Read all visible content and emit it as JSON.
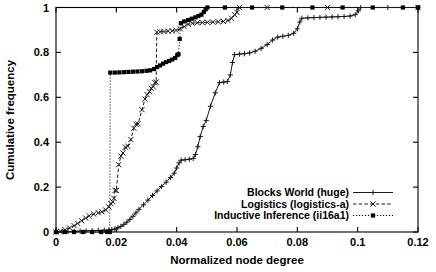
{
  "chart_data": {
    "type": "line",
    "title": "",
    "xlabel": "Normalized node degree",
    "ylabel": "Cumulative frequency",
    "xlim": [
      0,
      0.12
    ],
    "ylim": [
      0,
      1
    ],
    "xticks": [
      "0",
      "0.02",
      "0.04",
      "0.06",
      "0.08",
      "0.1",
      "0.12"
    ],
    "xtick_values": [
      0,
      0.02,
      0.04,
      0.06,
      0.08,
      0.1,
      0.12
    ],
    "yticks": [
      "0",
      "0.2",
      "0.4",
      "0.6",
      "0.8",
      "1"
    ],
    "ytick_values": [
      0,
      0.2,
      0.4,
      0.6,
      0.8,
      1
    ],
    "grid": false,
    "legend_position": "lower right",
    "series": [
      {
        "name": "Blocks World (huge)",
        "marker": "plus",
        "linestyle": "solid",
        "color": "#1a1a1a",
        "points": [
          [
            0.0,
            0.0
          ],
          [
            0.002,
            0.001
          ],
          [
            0.004,
            0.002
          ],
          [
            0.006,
            0.003
          ],
          [
            0.008,
            0.004
          ],
          [
            0.01,
            0.005
          ],
          [
            0.012,
            0.006
          ],
          [
            0.014,
            0.007
          ],
          [
            0.016,
            0.008
          ],
          [
            0.0175,
            0.009
          ],
          [
            0.0185,
            0.01
          ],
          [
            0.0195,
            0.013
          ],
          [
            0.0205,
            0.018
          ],
          [
            0.0215,
            0.025
          ],
          [
            0.0225,
            0.034
          ],
          [
            0.0235,
            0.044
          ],
          [
            0.0245,
            0.056
          ],
          [
            0.0255,
            0.07
          ],
          [
            0.0265,
            0.085
          ],
          [
            0.0275,
            0.101
          ],
          [
            0.029,
            0.121
          ],
          [
            0.0305,
            0.142
          ],
          [
            0.032,
            0.163
          ],
          [
            0.0335,
            0.183
          ],
          [
            0.035,
            0.203
          ],
          [
            0.0365,
            0.222
          ],
          [
            0.038,
            0.243
          ],
          [
            0.0392,
            0.262
          ],
          [
            0.04,
            0.285
          ],
          [
            0.0408,
            0.308
          ],
          [
            0.0415,
            0.32
          ],
          [
            0.0428,
            0.322
          ],
          [
            0.0442,
            0.324
          ],
          [
            0.0455,
            0.328
          ],
          [
            0.0462,
            0.345
          ],
          [
            0.047,
            0.38
          ],
          [
            0.0478,
            0.425
          ],
          [
            0.0488,
            0.47
          ],
          [
            0.0498,
            0.497
          ],
          [
            0.0512,
            0.56
          ],
          [
            0.0528,
            0.62
          ],
          [
            0.0542,
            0.665
          ],
          [
            0.0556,
            0.668
          ],
          [
            0.0568,
            0.67
          ],
          [
            0.0578,
            0.7
          ],
          [
            0.0585,
            0.755
          ],
          [
            0.0592,
            0.79
          ],
          [
            0.0608,
            0.792
          ],
          [
            0.0625,
            0.794
          ],
          [
            0.0642,
            0.798
          ],
          [
            0.066,
            0.805
          ],
          [
            0.068,
            0.818
          ],
          [
            0.07,
            0.835
          ],
          [
            0.0718,
            0.855
          ],
          [
            0.0735,
            0.868
          ],
          [
            0.0752,
            0.872
          ],
          [
            0.077,
            0.876
          ],
          [
            0.0788,
            0.885
          ],
          [
            0.08,
            0.905
          ],
          [
            0.0808,
            0.935
          ],
          [
            0.0815,
            0.952
          ],
          [
            0.0835,
            0.954
          ],
          [
            0.0855,
            0.955
          ],
          [
            0.0875,
            0.956
          ],
          [
            0.0895,
            0.957
          ],
          [
            0.0915,
            0.958
          ],
          [
            0.0935,
            0.959
          ],
          [
            0.0955,
            0.96
          ],
          [
            0.0975,
            0.962
          ],
          [
            0.0992,
            0.968
          ],
          [
            0.1002,
            0.985
          ],
          [
            0.101,
            1.0
          ],
          [
            0.11,
            1.0
          ],
          [
            0.12,
            1.0
          ]
        ]
      },
      {
        "name": "Logistics (logistics-a)",
        "marker": "cross",
        "linestyle": "dashed",
        "color": "#1a1a1a",
        "points": [
          [
            0.0,
            0.0
          ],
          [
            0.0015,
            0.004
          ],
          [
            0.003,
            0.01
          ],
          [
            0.0045,
            0.018
          ],
          [
            0.006,
            0.028
          ],
          [
            0.0072,
            0.038
          ],
          [
            0.0085,
            0.05
          ],
          [
            0.0098,
            0.062
          ],
          [
            0.011,
            0.072
          ],
          [
            0.0125,
            0.08
          ],
          [
            0.014,
            0.086
          ],
          [
            0.0152,
            0.09
          ],
          [
            0.0165,
            0.098
          ],
          [
            0.0175,
            0.112
          ],
          [
            0.0182,
            0.126
          ],
          [
            0.0188,
            0.135
          ],
          [
            0.0192,
            0.15
          ],
          [
            0.0196,
            0.185
          ],
          [
            0.02,
            0.185
          ],
          [
            0.0208,
            0.3
          ],
          [
            0.0215,
            0.338
          ],
          [
            0.0222,
            0.352
          ],
          [
            0.023,
            0.378
          ],
          [
            0.0238,
            0.382
          ],
          [
            0.0248,
            0.412
          ],
          [
            0.0258,
            0.462
          ],
          [
            0.0265,
            0.48
          ],
          [
            0.0272,
            0.482
          ],
          [
            0.0285,
            0.545
          ],
          [
            0.0295,
            0.592
          ],
          [
            0.0302,
            0.612
          ],
          [
            0.031,
            0.625
          ],
          [
            0.0316,
            0.64
          ],
          [
            0.0322,
            0.648
          ],
          [
            0.0328,
            0.665
          ],
          [
            0.0332,
            0.668
          ],
          [
            0.0334,
            0.89
          ],
          [
            0.0345,
            0.892
          ],
          [
            0.0358,
            0.893
          ],
          [
            0.0372,
            0.895
          ],
          [
            0.0385,
            0.896
          ],
          [
            0.0398,
            0.898
          ],
          [
            0.0412,
            0.905
          ],
          [
            0.0425,
            0.915
          ],
          [
            0.0438,
            0.925
          ],
          [
            0.0452,
            0.93
          ],
          [
            0.0468,
            0.932
          ],
          [
            0.0485,
            0.933
          ],
          [
            0.0502,
            0.934
          ],
          [
            0.052,
            0.935
          ],
          [
            0.0538,
            0.936
          ],
          [
            0.0555,
            0.938
          ],
          [
            0.057,
            0.942
          ],
          [
            0.0582,
            0.952
          ],
          [
            0.0592,
            0.968
          ],
          [
            0.06,
            0.978
          ],
          [
            0.0608,
            1.0
          ],
          [
            0.07,
            1.0
          ],
          [
            0.09,
            1.0
          ],
          [
            0.12,
            1.0
          ]
        ]
      },
      {
        "name": "Inductive Inference (ii16a1)",
        "marker": "square",
        "linestyle": "dotted",
        "color": "#000000",
        "points": [
          [
            0.0,
            0.0
          ],
          [
            0.003,
            0.0
          ],
          [
            0.006,
            0.0
          ],
          [
            0.009,
            0.0
          ],
          [
            0.012,
            0.0
          ],
          [
            0.015,
            0.0
          ],
          [
            0.017,
            0.0
          ],
          [
            0.0178,
            0.0
          ],
          [
            0.018,
            0.71
          ],
          [
            0.0195,
            0.71
          ],
          [
            0.021,
            0.711
          ],
          [
            0.0225,
            0.712
          ],
          [
            0.024,
            0.713
          ],
          [
            0.0255,
            0.714
          ],
          [
            0.027,
            0.715
          ],
          [
            0.0285,
            0.716
          ],
          [
            0.03,
            0.718
          ],
          [
            0.0312,
            0.72
          ],
          [
            0.0325,
            0.726
          ],
          [
            0.0335,
            0.735
          ],
          [
            0.0345,
            0.742
          ],
          [
            0.0355,
            0.75
          ],
          [
            0.0365,
            0.757
          ],
          [
            0.0375,
            0.762
          ],
          [
            0.0385,
            0.768
          ],
          [
            0.0395,
            0.775
          ],
          [
            0.0402,
            0.788
          ],
          [
            0.0406,
            0.792
          ],
          [
            0.041,
            0.86
          ],
          [
            0.0414,
            0.93
          ],
          [
            0.0425,
            0.938
          ],
          [
            0.0438,
            0.944
          ],
          [
            0.045,
            0.95
          ],
          [
            0.0462,
            0.956
          ],
          [
            0.0472,
            0.962
          ],
          [
            0.0482,
            0.968
          ],
          [
            0.049,
            0.98
          ],
          [
            0.0496,
            0.992
          ],
          [
            0.0502,
            1.0
          ],
          [
            0.056,
            1.0
          ],
          [
            0.065,
            1.0
          ],
          [
            0.075,
            1.0
          ],
          [
            0.085,
            1.0
          ],
          [
            0.095,
            1.0
          ],
          [
            0.105,
            1.0
          ],
          [
            0.115,
            1.0
          ],
          [
            0.12,
            1.0
          ]
        ]
      }
    ]
  },
  "legend": {
    "entries": [
      {
        "label": "Blocks World (huge)"
      },
      {
        "label": "Logistics (logistics-a)"
      },
      {
        "label": "Inductive Inference (ii16a1)"
      }
    ]
  }
}
